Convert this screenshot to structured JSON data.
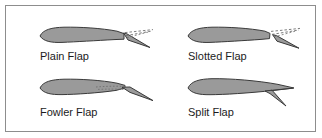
{
  "figure": {
    "name": "aircraft-wing-flap-types-diagram",
    "background_color": "#ffffff",
    "border_color": "#8d8d8d",
    "airfoil_fill": "#9a9a9a",
    "airfoil_stroke": "#3a3a3a",
    "guide_line_color": "#6f6f6f",
    "label_color": "#1c1c1c"
  },
  "panels": [
    {
      "id": "plain-flap",
      "label": "Plain Flap",
      "description": "Airfoil with trailing-edge section hinged downward; dashed lines show the undeflected flap position."
    },
    {
      "id": "slotted-flap",
      "label": "Slotted Flap",
      "description": "Airfoil with trailing-edge flap deflected down leaving an open slot between wing and flap; dashed lines show the undeflected position."
    },
    {
      "id": "fowler-flap",
      "label": "Fowler Flap",
      "description": "Airfoil with trailing-edge flap extended rearward and downward along a track; dotted line shows the retracted flap position."
    },
    {
      "id": "split-flap",
      "label": "Split Flap",
      "description": "Airfoil with lower trailing-edge surface deflected downward while the upper surface remains undeflected."
    }
  ]
}
